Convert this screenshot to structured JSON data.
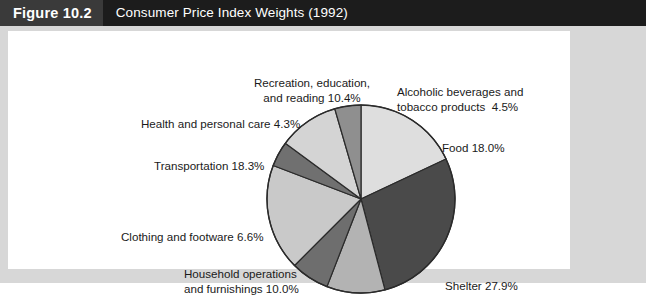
{
  "header": {
    "figure_number": "Figure 10.2",
    "title": "Consumer Price Index Weights (1992)"
  },
  "colors": {
    "header_bar": "#1c1c1c",
    "header_number_box": "#3a3a3a",
    "header_text": "#ffffff",
    "frame": "#d7d7d7",
    "panel": "#ffffff",
    "label_text": "#1a1a1a",
    "pie_outline": "#2b2b2b"
  },
  "labels": {
    "recreation": "Recreation, education,\nand reading 10.4%",
    "alcohol": "Alcoholic beverages and\ntobacco products  4.5%",
    "health": "Health and personal care 4.3%",
    "food": "Food 18.0%",
    "transportation": "Transportation 18.3%",
    "clothing": "Clothing and footware 6.6%",
    "household": "Household operations\nand furnishings 10.0%",
    "shelter": "Shelter 27.9%"
  },
  "chart_data": {
    "type": "pie",
    "title": "Consumer Price Index Weights (1992)",
    "unit": "percent",
    "start_angle_deg": 0,
    "direction": "clockwise",
    "legend": "none (labels placed around pie)",
    "categories": [
      "Food",
      "Shelter",
      "Household operations and furnishings",
      "Clothing and footware",
      "Transportation",
      "Health and personal care",
      "Recreation, education, and reading",
      "Alcoholic beverages and tobacco products"
    ],
    "values": [
      18.0,
      27.9,
      10.0,
      6.6,
      18.3,
      4.3,
      10.4,
      4.5
    ],
    "slice_colors": [
      "#dedede",
      "#4a4a4a",
      "#b3b3b3",
      "#6e6e6e",
      "#c9c9c9",
      "#707070",
      "#d4d4d4",
      "#8f8f8f"
    ],
    "slices": [
      {
        "label": "Food",
        "value": 18.0,
        "color": "#dedede"
      },
      {
        "label": "Shelter",
        "value": 27.9,
        "color": "#4a4a4a"
      },
      {
        "label": "Household operations and furnishings",
        "value": 10.0,
        "color": "#b3b3b3"
      },
      {
        "label": "Clothing and footware",
        "value": 6.6,
        "color": "#6e6e6e"
      },
      {
        "label": "Transportation",
        "value": 18.3,
        "color": "#c9c9c9"
      },
      {
        "label": "Health and personal care",
        "value": 4.3,
        "color": "#707070"
      },
      {
        "label": "Recreation, education, and reading",
        "value": 10.4,
        "color": "#d4d4d4"
      },
      {
        "label": "Alcoholic beverages and tobacco products",
        "value": 4.5,
        "color": "#8f8f8f"
      }
    ],
    "total": 100.0
  }
}
